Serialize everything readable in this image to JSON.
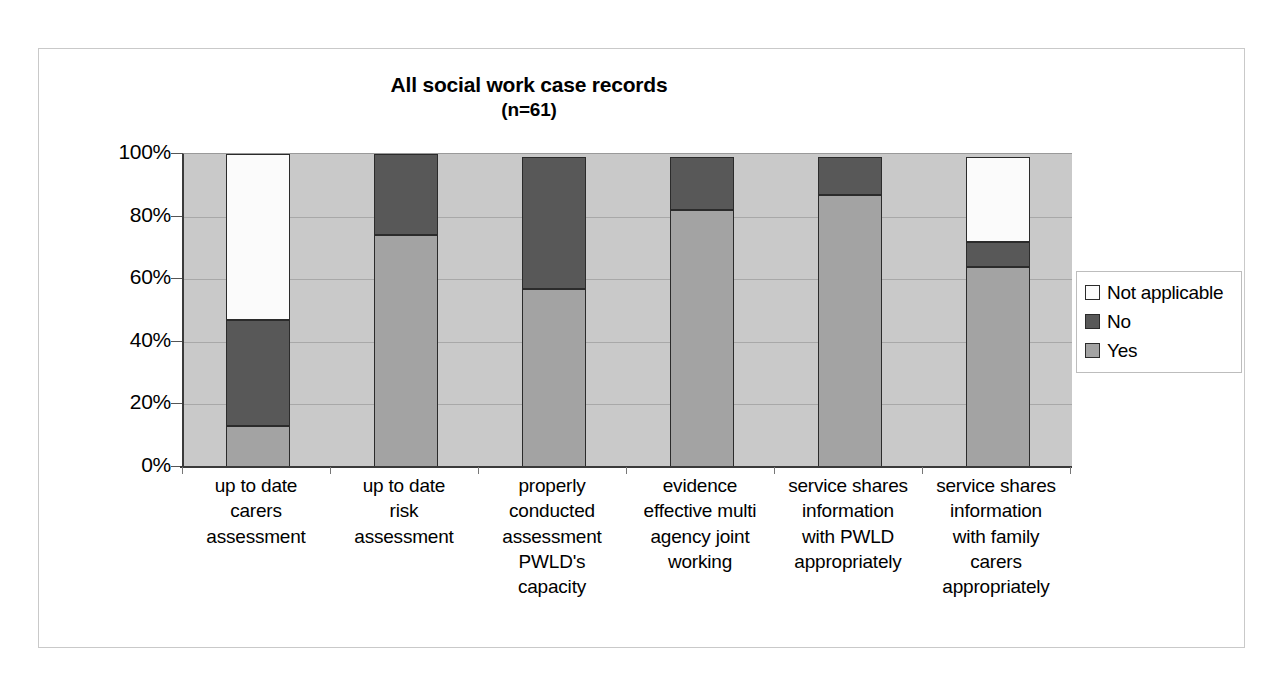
{
  "chart_data": {
    "type": "bar",
    "stacked": true,
    "stack_mode": "percent",
    "title": "All social work case records",
    "subtitle": "(n=61)",
    "xlabel": "",
    "ylabel": "",
    "ylim": [
      0,
      100
    ],
    "ytick_labels": [
      "100%",
      "80%",
      "60%",
      "40%",
      "20%",
      "0%"
    ],
    "ytick_values": [
      100,
      80,
      60,
      40,
      20,
      0
    ],
    "grid": true,
    "grid_axis": "y",
    "legend_position": "right",
    "categories": [
      "up to date carers assessment",
      "up to date risk assessment",
      "properly conducted assessment PWLD's capacity",
      "evidence effective multi agency joint working",
      "service shares information with PWLD appropriately",
      "service shares information with family carers appropriately"
    ],
    "category_lines": [
      [
        "up to date",
        "carers",
        "assessment"
      ],
      [
        "up to date",
        "risk",
        "assessment"
      ],
      [
        "properly",
        "conducted",
        "assessment",
        "PWLD's",
        "capacity"
      ],
      [
        "evidence",
        "effective multi",
        "agency joint",
        "working"
      ],
      [
        "service shares",
        "information",
        "with PWLD",
        "appropriately"
      ],
      [
        "service shares",
        "information",
        "with family",
        "carers",
        "appropriately"
      ]
    ],
    "series": [
      {
        "name": "Yes",
        "color": "#a3a3a3",
        "values": [
          13,
          74,
          57,
          82,
          87,
          64
        ]
      },
      {
        "name": "No",
        "color": "#585858",
        "values": [
          34,
          26,
          42,
          17,
          12,
          8
        ]
      },
      {
        "name": "Not applicable",
        "color": "#fbfbfb",
        "values": [
          53,
          0,
          0,
          0,
          0,
          27
        ]
      }
    ],
    "legend_entries": [
      {
        "label": "Not applicable",
        "color": "#fbfbfb"
      },
      {
        "label": "No",
        "color": "#585858"
      },
      {
        "label": "Yes",
        "color": "#a3a3a3"
      }
    ],
    "plot_background": "#c9c9c9",
    "border_color": "#2b2b2b"
  }
}
